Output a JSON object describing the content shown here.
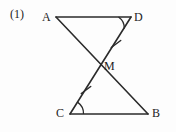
{
  "figure": {
    "item_number": "(1)",
    "caption": "",
    "stroke_color": "#2b2b2b",
    "background_color": "#fdfdfd",
    "text_color": "#1c1c1c",
    "points": [
      {
        "name": "A",
        "label": "A",
        "x": 56,
        "y": 17
      },
      {
        "name": "D",
        "label": "D",
        "x": 131,
        "y": 17
      },
      {
        "name": "M",
        "label": "M",
        "x": 101,
        "y": 66
      },
      {
        "name": "C",
        "label": "C",
        "x": 70,
        "y": 114
      },
      {
        "name": "B",
        "label": "B",
        "x": 148,
        "y": 114
      }
    ],
    "segments": [
      {
        "name": "AD",
        "from": "A",
        "to": "D"
      },
      {
        "name": "CB",
        "from": "C",
        "to": "B"
      },
      {
        "name": "AB",
        "from": "A",
        "to": "B"
      },
      {
        "name": "DC",
        "from": "D",
        "to": "C"
      }
    ],
    "tick_marks": [
      {
        "name": "tick-DM",
        "on_segment": "DC",
        "x": 116,
        "y": 44,
        "count": 1
      },
      {
        "name": "tick-CM",
        "on_segment": "DC",
        "x": 86,
        "y": 90,
        "count": 1
      }
    ],
    "angle_marks": [
      {
        "name": "angle-D",
        "at_vertex": "D",
        "count": 1
      },
      {
        "name": "angle-C",
        "at_vertex": "C",
        "count": 1
      }
    ]
  }
}
